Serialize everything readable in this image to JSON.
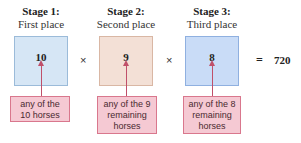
{
  "stages": [
    {
      "title": "Stage 1:",
      "subtitle": "First place",
      "value": "10",
      "label_lines": [
        "any of the",
        "10 horses"
      ],
      "box_color": "#d6e6f5",
      "box_border": "#9bbbd9"
    },
    {
      "title": "Stage 2:",
      "subtitle": "Second place",
      "value": "9",
      "label_lines": [
        "any of the 9",
        "remaining",
        "horses"
      ],
      "box_color": "#f3e0d6",
      "box_border": "#d9b7a4"
    },
    {
      "title": "Stage 3:",
      "subtitle": "Third place",
      "value": "8",
      "label_lines": [
        "any of the 8",
        "remaining",
        "horses"
      ],
      "box_color": "#c9dcf7",
      "box_border": "#8fb0e0"
    }
  ],
  "operators": [
    "×",
    "×"
  ],
  "equals": "=",
  "result": "720",
  "colors": {
    "arrow": "#c0506a",
    "label_bg": "#f5c9d3",
    "label_border": "#d9778d"
  }
}
